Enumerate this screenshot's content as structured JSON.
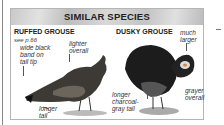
{
  "panel": {
    "title": "SIMILAR SPECIES",
    "species": [
      {
        "name": "RUFFED GROUSE",
        "reference": "see p.66",
        "notes": [
          "wide black band on tail tip",
          "lighter overall",
          "longer tail"
        ],
        "illustration": "ruffed-grouse-illustration"
      },
      {
        "name": "DUSKY GROUSE",
        "notes": [
          "much larger",
          "longer charcoal-gray tail",
          "grayer overall"
        ],
        "illustration": "dusky-grouse-illustration"
      }
    ]
  },
  "notes_lines": {
    "r_band_1": "wide black",
    "r_band_2": "band on",
    "r_band_3": "tail tip",
    "r_lighter_1": "lighter",
    "r_lighter_2": "overall",
    "r_longer_1": "longer",
    "r_longer_2": "tail",
    "d_larger_1": "much",
    "d_larger_2": "larger",
    "d_tail_1": "longer",
    "d_tail_2": "charcoal-",
    "d_tail_3": "gray tail",
    "d_grayer_1": "grayer",
    "d_grayer_2": "overall"
  }
}
